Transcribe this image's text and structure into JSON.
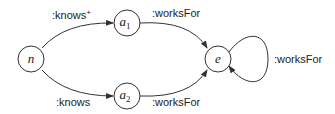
{
  "diagram": {
    "nodes": [
      {
        "id": "n",
        "label": "n"
      },
      {
        "id": "a1",
        "label": "a",
        "subscript": "1"
      },
      {
        "id": "a2",
        "label": "a",
        "subscript": "2"
      },
      {
        "id": "e",
        "label": "e"
      }
    ],
    "edges": [
      {
        "from": "n",
        "to": "a1",
        "label": ":knows",
        "superscript": "+"
      },
      {
        "from": "n",
        "to": "a2",
        "label": ":knows"
      },
      {
        "from": "a1",
        "to": "e",
        "label": ":worksFor"
      },
      {
        "from": "a2",
        "to": "e",
        "label": ":worksFor"
      },
      {
        "from": "e",
        "to": "e",
        "label": ":worksFor"
      }
    ]
  }
}
